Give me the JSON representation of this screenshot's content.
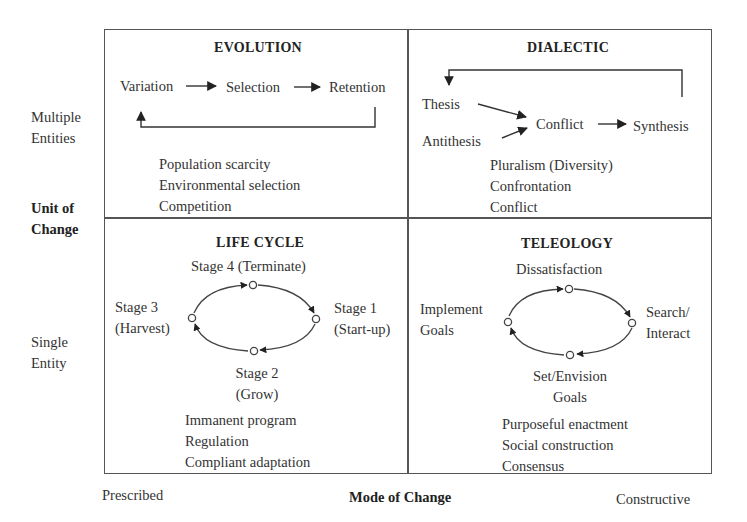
{
  "axes": {
    "y_title": [
      "Unit of",
      "Change"
    ],
    "y_top_label": [
      "Multiple",
      "Entities"
    ],
    "y_bottom_label": [
      "Single",
      "Entity"
    ],
    "x_title": "Mode of Change",
    "x_left_label": "Prescribed",
    "x_right_label": "Constructive"
  },
  "quadrants": {
    "evolution": {
      "title": "EVOLUTION",
      "flow": [
        "Variation",
        "Selection",
        "Retention"
      ],
      "attributes": [
        "Population scarcity",
        "Environmental selection",
        "Competition"
      ]
    },
    "dialectic": {
      "title": "DIALECTIC",
      "inputs": [
        "Thesis",
        "Antithesis"
      ],
      "middle": "Conflict",
      "result": "Synthesis",
      "attributes": [
        "Pluralism (Diversity)",
        "Confrontation",
        "Conflict"
      ]
    },
    "life_cycle": {
      "title": "LIFE CYCLE",
      "stages": {
        "top": "Stage 4 (Terminate)",
        "right": [
          "Stage 1",
          "(Start-up)"
        ],
        "bottom": [
          "Stage 2",
          "(Grow)"
        ],
        "left": [
          "Stage 3",
          "(Harvest)"
        ]
      },
      "attributes": [
        "Immanent program",
        "Regulation",
        "Compliant adaptation"
      ]
    },
    "teleology": {
      "title": "TELEOLOGY",
      "stages": {
        "top": "Dissatisfaction",
        "right": [
          "Search/",
          "Interact"
        ],
        "bottom": [
          "Set/Envision",
          "Goals"
        ],
        "left": [
          "Implement",
          "Goals"
        ]
      },
      "attributes": [
        "Purposeful enactment",
        "Social construction",
        "Consensus"
      ]
    }
  },
  "colors": {
    "line": "#555555",
    "text": "#333333",
    "background": "#ffffff"
  }
}
